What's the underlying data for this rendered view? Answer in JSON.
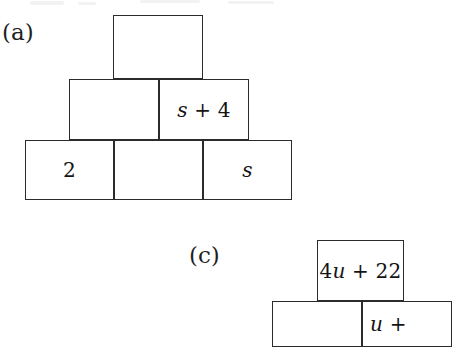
{
  "page": {
    "background_color": "#ffffff",
    "line_color": "#2b2b2b",
    "text_color": "#141414"
  },
  "parts": [
    {
      "id": "a",
      "label": "(a)",
      "label_position": {
        "x": 2,
        "y": 21
      },
      "pyramid": {
        "name": "number-pyramid-a",
        "rows": [
          {
            "row_index": 0,
            "bricks": [
              {
                "id": "a-r0-c0",
                "text": "",
                "x": 113,
                "y": 15,
                "w": 90,
                "h": 64
              }
            ]
          },
          {
            "row_index": 1,
            "bricks": [
              {
                "id": "a-r1-c0",
                "text": "",
                "x": 69,
                "y": 79,
                "w": 90,
                "h": 61
              },
              {
                "id": "a-r1-c1",
                "text": "s + 4",
                "x": 159,
                "y": 79,
                "w": 90,
                "h": 61
              }
            ]
          },
          {
            "row_index": 2,
            "bricks": [
              {
                "id": "a-r2-c0",
                "text": "2",
                "x": 25,
                "y": 140,
                "w": 89,
                "h": 60
              },
              {
                "id": "a-r2-c1",
                "text": "",
                "x": 114,
                "y": 140,
                "w": 89,
                "h": 60
              },
              {
                "id": "a-r2-c2",
                "text": "s",
                "x": 203,
                "y": 140,
                "w": 89,
                "h": 60
              }
            ]
          }
        ]
      }
    },
    {
      "id": "c",
      "label": "(c)",
      "label_position": {
        "x": 189,
        "y": 244
      },
      "pyramid": {
        "name": "number-pyramid-c",
        "rows": [
          {
            "row_index": 0,
            "bricks": [
              {
                "id": "c-r0-c0",
                "text": "4u + 22",
                "x": 317,
                "y": 240,
                "w": 87,
                "h": 61
              }
            ]
          },
          {
            "row_index": 1,
            "bricks": [
              {
                "id": "c-r1-c0",
                "text": "",
                "x": 272,
                "y": 301,
                "w": 90,
                "h": 42
              },
              {
                "id": "c-r1-c1",
                "text": "u +",
                "x": 362,
                "y": 301,
                "w": 90,
                "h": 42
              }
            ]
          }
        ]
      }
    }
  ],
  "expressions": {
    "a_middle_right": {
      "variable": "s",
      "operator": "+",
      "constant": "4",
      "full": "s + 4"
    },
    "a_bottom_left": {
      "full": "2"
    },
    "a_bottom_right": {
      "variable": "s",
      "full": "s"
    },
    "c_top": {
      "coefficient": "4",
      "variable": "u",
      "operator": "+",
      "constant": "22",
      "full": "4u + 22"
    },
    "c_bottom_right": {
      "variable": "u",
      "operator": "+",
      "full": "u +",
      "clipped": true
    }
  }
}
